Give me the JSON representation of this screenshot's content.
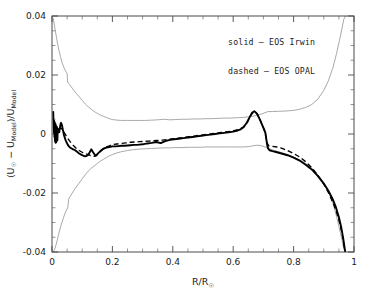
{
  "chart_data": {
    "type": "line",
    "title": "",
    "subtitle": "",
    "xlabel": "R/R☉",
    "ylabel": "(U☉ − U_Model)/U_Model",
    "xlim": [
      0,
      1
    ],
    "ylim": [
      -0.04,
      0.04
    ],
    "grid": false,
    "legend_position": "upper-right-inside",
    "xticks": [
      "0",
      "0.2",
      "0.4",
      "0.6",
      "0.8",
      "1"
    ],
    "xtick_values": [
      0,
      0.2,
      0.4,
      0.6,
      0.8,
      1
    ],
    "xtick_minor_step": 0.05,
    "yticks": [
      "0.04",
      "0.02",
      "0",
      "-0.02",
      "-0.04"
    ],
    "ytick_values": [
      0.04,
      0.02,
      0,
      -0.02,
      -0.04
    ],
    "ytick_minor_step": 0.005,
    "legend": [
      {
        "key": "solid",
        "dash": "solid",
        "label": "solid – EOS Irwin"
      },
      {
        "key": "dashed",
        "dash": "dashed",
        "label": "dashed – EOS OPAL"
      }
    ],
    "series": [
      {
        "name": "EOS Irwin",
        "style": "solid",
        "color": "#000000",
        "width": 1.9,
        "x": [
          0.004,
          0.006,
          0.007,
          0.008,
          0.009,
          0.01,
          0.011,
          0.012,
          0.013,
          0.014,
          0.015,
          0.016,
          0.017,
          0.018,
          0.019,
          0.02,
          0.022,
          0.024,
          0.026,
          0.028,
          0.03,
          0.033,
          0.036,
          0.04,
          0.044,
          0.048,
          0.052,
          0.056,
          0.06,
          0.065,
          0.07,
          0.075,
          0.08,
          0.085,
          0.09,
          0.095,
          0.1,
          0.105,
          0.11,
          0.115,
          0.12,
          0.125,
          0.13,
          0.135,
          0.14,
          0.145,
          0.15,
          0.16,
          0.17,
          0.18,
          0.19,
          0.2,
          0.21,
          0.22,
          0.23,
          0.24,
          0.25,
          0.26,
          0.27,
          0.28,
          0.29,
          0.3,
          0.315,
          0.33,
          0.345,
          0.36,
          0.375,
          0.39,
          0.405,
          0.42,
          0.435,
          0.45,
          0.465,
          0.48,
          0.495,
          0.51,
          0.525,
          0.54,
          0.555,
          0.57,
          0.585,
          0.6,
          0.615,
          0.625,
          0.635,
          0.645,
          0.655,
          0.663,
          0.67,
          0.678,
          0.685,
          0.692,
          0.698,
          0.703,
          0.707,
          0.71,
          0.713,
          0.716,
          0.72,
          0.73,
          0.745,
          0.76,
          0.78,
          0.8,
          0.82,
          0.84,
          0.86,
          0.88,
          0.9,
          0.915,
          0.93,
          0.94,
          0.95,
          0.958,
          0.964,
          0.968,
          0.971
        ],
        "y": [
          0.0075,
          0.0005,
          0.0045,
          -0.001,
          0.004,
          -0.0025,
          0.0035,
          -0.003,
          0.003,
          -0.0028,
          0.0026,
          -0.0024,
          0.0022,
          -0.002,
          0.0018,
          0.0014,
          0.001,
          0.0006,
          0.002,
          0.0032,
          0.0038,
          0.003,
          0.0014,
          -0.0005,
          -0.0018,
          -0.0028,
          -0.0036,
          -0.0042,
          -0.0046,
          -0.0049,
          -0.0052,
          -0.0054,
          -0.0058,
          -0.0062,
          -0.0066,
          -0.0069,
          -0.0072,
          -0.0074,
          -0.0076,
          -0.0074,
          -0.007,
          -0.0062,
          -0.0052,
          -0.006,
          -0.0068,
          -0.0074,
          -0.0068,
          -0.0058,
          -0.005,
          -0.0046,
          -0.0044,
          -0.0042,
          -0.0042,
          -0.0041,
          -0.004,
          -0.004,
          -0.0039,
          -0.0038,
          -0.0037,
          -0.0037,
          -0.0036,
          -0.0035,
          -0.0032,
          -0.003,
          -0.0027,
          -0.0031,
          -0.0024,
          -0.002,
          -0.0018,
          -0.0016,
          -0.0014,
          -0.0012,
          -0.001,
          -0.0008,
          -0.0006,
          -0.0004,
          -0.0002,
          0.0,
          0.0002,
          0.0004,
          0.0006,
          0.0008,
          0.0012,
          0.0016,
          0.0024,
          0.0038,
          0.0058,
          0.0073,
          0.0077,
          0.007,
          0.0056,
          0.004,
          0.0026,
          0.0014,
          0.0002,
          -0.002,
          -0.004,
          -0.005,
          -0.0055,
          -0.0058,
          -0.0062,
          -0.0066,
          -0.0072,
          -0.008,
          -0.009,
          -0.0104,
          -0.012,
          -0.0142,
          -0.0168,
          -0.0192,
          -0.0222,
          -0.0248,
          -0.0282,
          -0.0318,
          -0.0352,
          -0.038,
          -0.04
        ]
      },
      {
        "name": "EOS OPAL",
        "style": "dashed",
        "color": "#000000",
        "width": 1.35,
        "x": [
          0.02,
          0.03,
          0.04,
          0.05,
          0.06,
          0.07,
          0.08,
          0.09,
          0.1,
          0.11,
          0.12,
          0.13,
          0.14,
          0.15,
          0.16,
          0.17,
          0.18,
          0.19,
          0.2,
          0.215,
          0.23,
          0.245,
          0.26,
          0.275,
          0.29,
          0.305,
          0.32,
          0.335,
          0.35,
          0.365,
          0.38,
          0.395,
          0.41,
          0.425,
          0.44,
          0.455,
          0.47,
          0.485,
          0.5,
          0.515,
          0.53,
          0.545,
          0.56,
          0.575,
          0.59,
          0.605,
          0.62,
          0.635,
          0.648,
          0.66,
          0.67,
          0.68,
          0.69,
          0.698,
          0.704,
          0.708,
          0.712,
          0.718,
          0.73,
          0.745,
          0.76,
          0.78,
          0.8,
          0.82,
          0.84,
          0.86,
          0.88,
          0.9,
          0.915,
          0.93,
          0.94,
          0.95,
          0.958,
          0.964,
          0.968,
          0.971
        ],
        "y": [
          0.0015,
          0.002,
          0.0006,
          -0.0012,
          -0.0026,
          -0.0038,
          -0.0048,
          -0.0056,
          -0.0062,
          -0.0066,
          -0.007,
          -0.0074,
          -0.0076,
          -0.007,
          -0.006,
          -0.005,
          -0.0044,
          -0.004,
          -0.0036,
          -0.0034,
          -0.0032,
          -0.003,
          -0.0028,
          -0.0027,
          -0.0026,
          -0.0025,
          -0.0024,
          -0.0023,
          -0.0022,
          -0.0021,
          -0.0019,
          -0.0017,
          -0.0015,
          -0.0013,
          -0.0011,
          -0.0009,
          -0.0007,
          -0.0005,
          -0.0003,
          -0.0001,
          0.0001,
          0.0003,
          0.0005,
          0.0007,
          0.0009,
          0.0012,
          0.0016,
          0.0024,
          0.0042,
          0.0066,
          0.0076,
          0.0068,
          0.0046,
          0.0026,
          0.001,
          -0.0008,
          -0.003,
          -0.004,
          -0.0042,
          -0.0044,
          -0.0048,
          -0.0056,
          -0.0066,
          -0.0078,
          -0.0094,
          -0.0114,
          -0.014,
          -0.017,
          -0.0198,
          -0.0232,
          -0.0258,
          -0.0292,
          -0.0326,
          -0.0358,
          -0.0384,
          -0.0402
        ]
      },
      {
        "name": "upper error envelope",
        "style": "thin",
        "color": "#8c8c8c",
        "width": 0.75,
        "x": [
          0.004,
          0.01,
          0.016,
          0.022,
          0.028,
          0.034,
          0.04,
          0.046,
          0.05,
          0.052,
          0.058,
          0.065,
          0.072,
          0.08,
          0.09,
          0.1,
          0.11,
          0.12,
          0.13,
          0.14,
          0.15,
          0.16,
          0.17,
          0.18,
          0.19,
          0.2,
          0.215,
          0.23,
          0.25,
          0.27,
          0.29,
          0.31,
          0.33,
          0.35,
          0.37,
          0.39,
          0.41,
          0.43,
          0.45,
          0.47,
          0.49,
          0.51,
          0.53,
          0.55,
          0.57,
          0.59,
          0.61,
          0.63,
          0.65,
          0.665,
          0.68,
          0.695,
          0.705,
          0.715,
          0.73,
          0.75,
          0.775,
          0.8,
          0.82,
          0.84,
          0.86,
          0.88,
          0.9,
          0.915,
          0.93,
          0.942,
          0.952,
          0.96,
          0.966,
          0.971,
          0.975
        ],
        "y": [
          0.0392,
          0.0356,
          0.032,
          0.0288,
          0.0262,
          0.024,
          0.0224,
          0.0212,
          0.0206,
          0.0176,
          0.0168,
          0.0158,
          0.0148,
          0.0138,
          0.0126,
          0.0114,
          0.0102,
          0.0092,
          0.0084,
          0.0076,
          0.007,
          0.0064,
          0.006,
          0.0056,
          0.0052,
          0.0049,
          0.0047,
          0.0046,
          0.0046,
          0.0046,
          0.0046,
          0.0046,
          0.0047,
          0.0048,
          0.005,
          0.0048,
          0.0049,
          0.005,
          0.005,
          0.0051,
          0.0051,
          0.0052,
          0.0052,
          0.0053,
          0.0054,
          0.0054,
          0.0055,
          0.0056,
          0.0058,
          0.006,
          0.0064,
          0.0068,
          0.0072,
          0.0076,
          0.0076,
          0.0077,
          0.0078,
          0.008,
          0.0084,
          0.009,
          0.01,
          0.0118,
          0.0148,
          0.018,
          0.0224,
          0.0272,
          0.0318,
          0.0356,
          0.0388,
          0.04,
          0.04
        ]
      },
      {
        "name": "lower error envelope",
        "style": "thin",
        "color": "#8c8c8c",
        "width": 0.75,
        "x": [
          0.004,
          0.01,
          0.016,
          0.022,
          0.028,
          0.034,
          0.04,
          0.046,
          0.052,
          0.056,
          0.06,
          0.066,
          0.072,
          0.08,
          0.09,
          0.1,
          0.11,
          0.12,
          0.13,
          0.14,
          0.15,
          0.16,
          0.17,
          0.18,
          0.19,
          0.2,
          0.215,
          0.23,
          0.25,
          0.27,
          0.29,
          0.31,
          0.33,
          0.35,
          0.37,
          0.39,
          0.41,
          0.43,
          0.45,
          0.47,
          0.49,
          0.51,
          0.53,
          0.55,
          0.57,
          0.59,
          0.61,
          0.63,
          0.65,
          0.665,
          0.68,
          0.695,
          0.705,
          0.715,
          0.73,
          0.75,
          0.775,
          0.8,
          0.82,
          0.84,
          0.86,
          0.88,
          0.9,
          0.915,
          0.93,
          0.942,
          0.952,
          0.96,
          0.966,
          0.971,
          0.975
        ],
        "y": [
          -0.04,
          -0.0388,
          -0.0366,
          -0.034,
          -0.0316,
          -0.0296,
          -0.0278,
          -0.0262,
          -0.025,
          -0.0218,
          -0.0212,
          -0.0202,
          -0.0192,
          -0.018,
          -0.0166,
          -0.0152,
          -0.0138,
          -0.0126,
          -0.0116,
          -0.0108,
          -0.01,
          -0.0092,
          -0.0086,
          -0.008,
          -0.0074,
          -0.007,
          -0.0064,
          -0.006,
          -0.0056,
          -0.0053,
          -0.0051,
          -0.005,
          -0.0049,
          -0.0048,
          -0.0047,
          -0.0047,
          -0.0046,
          -0.0046,
          -0.0045,
          -0.0045,
          -0.0045,
          -0.0044,
          -0.0044,
          -0.0044,
          -0.0044,
          -0.0044,
          -0.0044,
          -0.0044,
          -0.0043,
          -0.004,
          -0.0038,
          -0.004,
          -0.0044,
          -0.0048,
          -0.0054,
          -0.006,
          -0.0068,
          -0.0078,
          -0.0088,
          -0.01,
          -0.0116,
          -0.0138,
          -0.0166,
          -0.0194,
          -0.0234,
          -0.0278,
          -0.0322,
          -0.0358,
          -0.0388,
          -0.04,
          -0.04
        ]
      }
    ]
  },
  "axes": {
    "x_title_main": "R/R",
    "x_title_sub": "☉",
    "y_title_parts": {
      "open": "(U",
      "sun": "☉",
      "minus": " − U",
      "model1": "Model",
      "close": ")/U",
      "model2": "Model"
    }
  }
}
